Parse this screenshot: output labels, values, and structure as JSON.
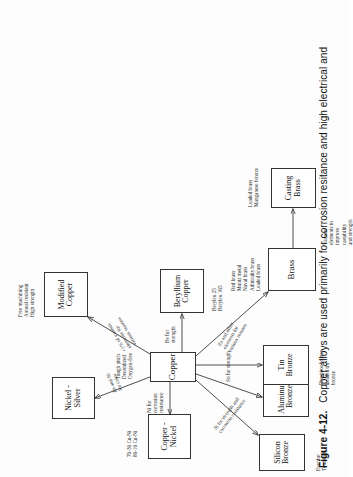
{
  "figure": {
    "label": "Figure 4-12.",
    "caption": "Copper alloys are used primarily for corrosion resitance and high electrical and"
  },
  "diagram": {
    "type": "tree",
    "root": "Copper",
    "nodes": [
      {
        "id": "copper",
        "label": "Copper",
        "line1": "Copper",
        "line2": ""
      },
      {
        "id": "nickel-silver",
        "label": "Nickel - Silver",
        "line1": "Nickel -",
        "line2": "Silver"
      },
      {
        "id": "copper-nickel",
        "label": "Copper - Nickel",
        "line1": "Copper -",
        "line2": "Nickel"
      },
      {
        "id": "modified-copper",
        "label": "Modified Copper",
        "line1": "Modified",
        "line2": "Copper"
      },
      {
        "id": "beryllium-copper",
        "label": "Beryllium Copper",
        "line1": "Beryllium",
        "line2": "Copper"
      },
      {
        "id": "silicon-bronze",
        "label": "Silicon Bronze",
        "line1": "Silicon",
        "line2": "Bronze"
      },
      {
        "id": "aluminum-bronze",
        "label": "Aluminum Bronze",
        "line1": "Aluminum",
        "line2": "Bronze"
      },
      {
        "id": "tin-bronze",
        "label": "Tin Bronze",
        "line1": "Tin",
        "line2": "Bronze"
      },
      {
        "id": "brass",
        "label": "Brass",
        "line1": "Brass",
        "line2": ""
      },
      {
        "id": "casting-brass",
        "label": "Casting Brass",
        "line1": "Casting",
        "line2": "Brass"
      }
    ],
    "edges": [
      {
        "from": "copper",
        "to": "nickel-silver",
        "label": "Zn and Ni\nfor color"
      },
      {
        "from": "copper",
        "to": "copper-nickel",
        "label": "Ni for\ncorrosion\nresistance"
      },
      {
        "from": "copper",
        "to": "modified-copper",
        "label": "<1% of various\nelements for\nvarious reasons"
      },
      {
        "from": "copper",
        "to": "beryllium-copper",
        "label": "Be for\nstrength"
      },
      {
        "from": "copper",
        "to": "silicon-bronze",
        "label": "Si for strength and\ncorrosion resistance"
      },
      {
        "from": "copper",
        "to": "aluminum-bronze",
        "label": ""
      },
      {
        "from": "copper",
        "to": "tin-bronze",
        "label": "Sn for strength"
      },
      {
        "from": "copper",
        "to": "brass",
        "label": "Zn and other\nelements for\nvarious reasons"
      },
      {
        "from": "brass",
        "to": "casting-brass",
        "label": "Various\nelements to\nimprove\ncastability\nand strength"
      }
    ],
    "notes": [
      {
        "id": "note-copper",
        "owner": "copper",
        "text": "Tough pitch\nDeoxidized\nOxygen-free"
      },
      {
        "id": "note-copper-nickel",
        "owner": "copper-nickel",
        "text": "70-30 Cu-Ni\n80-10 Cu-Ni"
      },
      {
        "id": "note-modified-copper",
        "owner": "modified-copper",
        "text": "Free machining\nAnneal resistant\nHigh strength"
      },
      {
        "id": "note-beryllium-copper",
        "owner": "beryllium-copper",
        "text": "Berylco 25\nBerylco 165"
      },
      {
        "id": "note-silicon-bronze",
        "owner": "silicon-bronze",
        "text": "Everdur\nTombasil"
      },
      {
        "id": "note-tin-bronze",
        "owner": "tin-bronze",
        "text": "Phosphor bronze\nLeaded tin\nbronze"
      },
      {
        "id": "note-brass",
        "owner": "brass",
        "text": "Red brass\nMuntz metal\nNaval brass\nAdmiralty brass\nLeaded brass"
      },
      {
        "id": "note-casting-brass",
        "owner": "casting-brass",
        "text": "Leaded brass\nManganese bronze"
      }
    ]
  },
  "colors": {
    "ink": "#1a1a1a",
    "line": "#3a3a3a",
    "paper": "#fdfdfd"
  }
}
